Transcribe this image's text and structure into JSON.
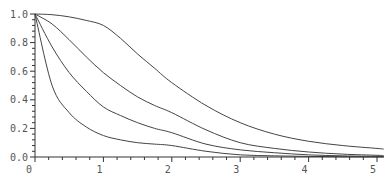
{
  "chart_data": {
    "type": "line",
    "title": "",
    "xlabel": "",
    "ylabel": "",
    "xlim": [
      0,
      5.1
    ],
    "ylim": [
      0,
      1.0
    ],
    "grid": false,
    "legend": null,
    "x_ticks": [
      "0",
      "1",
      "2",
      "3",
      "4",
      "5"
    ],
    "y_ticks": [
      "0.0",
      "0.2",
      "0.4",
      "0.6",
      "0.8",
      "1.0"
    ],
    "x": [
      0,
      0.25,
      0.5,
      0.75,
      1.0,
      1.25,
      1.5,
      1.75,
      2.0,
      2.5,
      3.0,
      3.5,
      4.0,
      4.5,
      5.0,
      5.1
    ],
    "series": [
      {
        "name": "curve-1",
        "values": [
          1.0,
          0.995,
          0.98,
          0.955,
          0.92,
          0.83,
          0.72,
          0.62,
          0.52,
          0.36,
          0.24,
          0.16,
          0.11,
          0.08,
          0.06,
          0.055
        ]
      },
      {
        "name": "curve-2",
        "values": [
          1.0,
          0.93,
          0.82,
          0.7,
          0.59,
          0.5,
          0.42,
          0.36,
          0.31,
          0.19,
          0.1,
          0.06,
          0.035,
          0.02,
          0.012,
          0.01
        ]
      },
      {
        "name": "curve-3",
        "values": [
          1.0,
          0.77,
          0.59,
          0.46,
          0.35,
          0.29,
          0.24,
          0.2,
          0.17,
          0.09,
          0.05,
          0.03,
          0.015,
          0.008,
          0.004,
          0.003
        ]
      },
      {
        "name": "curve-4",
        "values": [
          1.0,
          0.5,
          0.31,
          0.21,
          0.15,
          0.12,
          0.1,
          0.09,
          0.08,
          0.04,
          0.015,
          0.008,
          0.004,
          0.002,
          0.001,
          0.001
        ]
      }
    ]
  },
  "plot": {
    "origin_x": 35,
    "origin_y": 157,
    "x_scale": 68.4,
    "y_scale": 143
  }
}
